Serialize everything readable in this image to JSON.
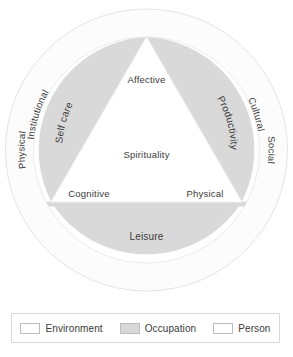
{
  "figure": {
    "colors": {
      "background": "#ffffff",
      "ring_fill": "#fbfbfb",
      "ring_stroke": "#e2e2e2",
      "occupation_fill": "#d8d8d8",
      "person_fill": "#ffffff",
      "text": "#3c3c3c",
      "legend_border": "#d8d8d8",
      "swatch_border": "#bdbdbd"
    },
    "environment": {
      "name": "Environment",
      "labels": [
        {
          "id": "physical",
          "text": "Physical"
        },
        {
          "id": "institutional",
          "text": "Institutional"
        },
        {
          "id": "cultural",
          "text": "Cultural"
        },
        {
          "id": "social",
          "text": "Social"
        }
      ]
    },
    "occupation": {
      "name": "Occupation",
      "labels": [
        {
          "id": "self-care",
          "text": "Self care"
        },
        {
          "id": "productivity",
          "text": "Productivity"
        },
        {
          "id": "leisure",
          "text": "Leisure"
        }
      ]
    },
    "person": {
      "name": "Person",
      "labels": [
        {
          "id": "affective",
          "text": "Affective"
        },
        {
          "id": "spirituality",
          "text": "Spirituality"
        },
        {
          "id": "cognitive",
          "text": "Cognitive"
        },
        {
          "id": "physical",
          "text": "Physical"
        }
      ]
    }
  },
  "legend": {
    "items": [
      {
        "id": "environment",
        "label": "Environment",
        "swatch": "#ffffff"
      },
      {
        "id": "occupation",
        "label": "Occupation",
        "swatch": "#d8d8d8"
      },
      {
        "id": "person",
        "label": "Person",
        "swatch": "#ffffff"
      }
    ]
  }
}
